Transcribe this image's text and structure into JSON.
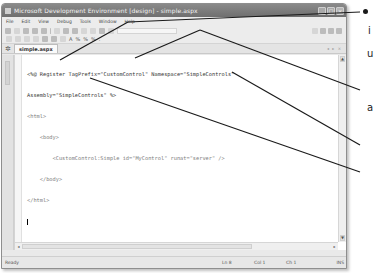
{
  "window": {
    "title": "Microsoft Development Environment [design] - simple.aspx",
    "buttons": [
      "minimize",
      "maximize",
      "close"
    ]
  },
  "menubar": {
    "items": [
      "File",
      "Edit",
      "View",
      "Debug",
      "Tools",
      "Window",
      "Help"
    ]
  },
  "toolbar2": {
    "format_labels": [
      "A",
      "%",
      "%",
      "%",
      "."
    ]
  },
  "tabs": {
    "active": "simple.aspx",
    "nav": "◂ ▸ ×"
  },
  "toolbox": {
    "label": "Toolbox"
  },
  "editor": {
    "lines": [
      "<%@ Register TagPrefix=\"CustomControl\" Namespace=\"SimpleControls\"",
      "Assembly=\"SimpleControls\" %>",
      "<html>",
      "    <body>",
      "        <CustomControl:Simple id=\"MyControl\" runat=\"server\" />",
      "    </body>",
      "</html>",
      ""
    ]
  },
  "statusbar": {
    "ready": "Ready",
    "ln": "Ln 8",
    "col": "Col 1",
    "ch": "Ch 1",
    "mode": "INS"
  },
  "callouts": {
    "right_texts": [
      "i",
      "u",
      "a"
    ]
  },
  "colors": {
    "titlebar": "#7a7a7a",
    "chrome": "#e9e9e9",
    "editor_bg": "#ffffff",
    "callout_line": "#1a1a1a"
  }
}
